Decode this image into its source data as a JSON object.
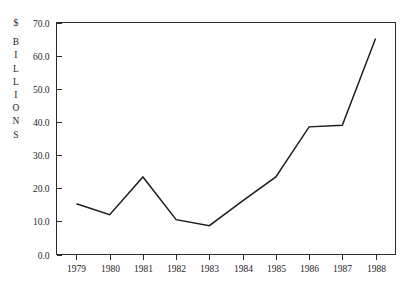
{
  "chart_data": {
    "type": "line",
    "title": "",
    "subtitle": "",
    "xlabel": "",
    "ylabel": "$ BILLIONS",
    "ylabel_stacked": [
      "$",
      "B",
      "I",
      "L",
      "L",
      "I",
      "O",
      "N",
      "S"
    ],
    "categories": [
      "1979",
      "1980",
      "1981",
      "1982",
      "1983",
      "1984",
      "1985",
      "1986",
      "1987",
      "1988"
    ],
    "x": [
      1979,
      1980,
      1981,
      1982,
      1983,
      1984,
      1985,
      1986,
      1987,
      1988
    ],
    "values": [
      15.3,
      12.0,
      23.4,
      10.5,
      8.7,
      16.2,
      23.4,
      38.5,
      39.0,
      65.2
    ],
    "series": [
      {
        "name": "",
        "values": [
          15.3,
          12.0,
          23.4,
          10.5,
          8.7,
          16.2,
          23.4,
          38.5,
          39.0,
          65.2
        ]
      }
    ],
    "ylim": [
      0,
      70
    ],
    "xlim": [
      1978.4,
      1988.6
    ],
    "ytick_values": [
      0,
      10,
      20,
      30,
      40,
      50,
      60,
      70
    ],
    "ytick_labels": [
      "0.0",
      "10.0",
      "20.0",
      "30.0",
      "40.0",
      "50.0",
      "60.0",
      "70.0"
    ],
    "xtick_labels": [
      "1979",
      "1980",
      "1981",
      "1982",
      "1983",
      "1984",
      "1985",
      "1986",
      "1987",
      "1988"
    ],
    "grid": false,
    "legend": false,
    "legend_position": "none",
    "line_color": "#1b1b1b",
    "axis_color": "#2a2a2a",
    "background_color": "#ffffff",
    "annotations": []
  }
}
